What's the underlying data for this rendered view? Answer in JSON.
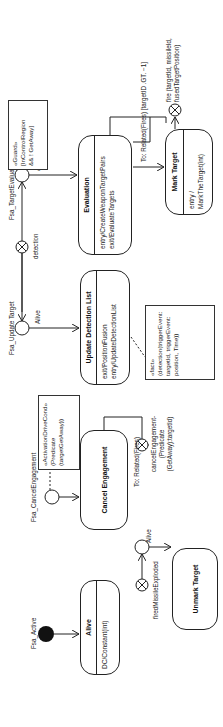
{
  "states": {
    "alive": {
      "title": "Alive",
      "body": [
        "DC/Constant(int)"
      ]
    },
    "unmark_target": {
      "title": "Unmark Target"
    },
    "cancel_engagement": {
      "title": "Cancel Engagement"
    },
    "update_detection_list": {
      "title": "Update Detection List",
      "body": [
        "exit/PositionFusion",
        "entry/UpdateDetectionList"
      ]
    },
    "evaluation": {
      "title": "Evaluation",
      "body": [
        "entry/CreateWeaponTargetPairs",
        "exit/EvaluateTargets"
      ]
    },
    "mark_target": {
      "title": "Mark Target",
      "body": [
        "entry / MarkTheTarget(int)"
      ]
    }
  },
  "notes": {
    "activation": [
      "«ActivationDriveCond»",
      "(Predicate",
      "(targetGetAway))"
    ],
    "fact": [
      "«fact»",
      "(detection(triggerEvent:",
      "targetId, triggerEvent:",
      "position, Time))"
    ],
    "guard": [
      "«Guard»",
      "[InControlRegion",
      "&& ! GetAway]"
    ]
  },
  "labels": {
    "fsa_active": "Fsa_Active",
    "fsa_cancel": "Fsa_CancelEngagement",
    "fsa_update": "Fsa_Update Target",
    "fsa_eval": "Fsa_TargetEvaluation",
    "alive1": "Alive",
    "alive2": "Alive",
    "alive3": "Alive",
    "fired_missile": "firedMissileExploded",
    "detection": "detection",
    "related_fires1": "To: Related(Fires)",
    "cancel_event": [
      "cancelEngagement-",
      "(Predicate",
      "(GetAway):targetId)"
    ],
    "related_fires2": "To: Related(Fires) [targetID .GT. −1]",
    "fire_event": [
      "fire (targetId, missileId,",
      "fusedTargetPosition)"
    ]
  }
}
